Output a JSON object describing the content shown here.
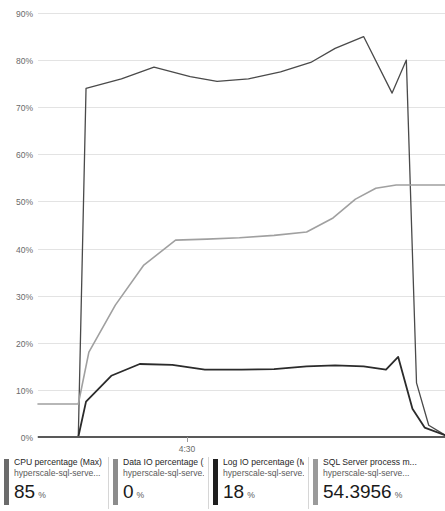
{
  "chart_data": {
    "type": "line",
    "title": "",
    "xlabel": "",
    "ylabel": "",
    "ylim": [
      0,
      90
    ],
    "y_ticks": [
      0,
      10,
      20,
      30,
      40,
      50,
      60,
      70,
      80,
      90
    ],
    "y_tick_labels": [
      "0%",
      "10%",
      "20%",
      "30%",
      "40%",
      "50%",
      "60%",
      "70%",
      "80%",
      "90%"
    ],
    "x_ticks": [
      "4:30"
    ],
    "x_tick_labels": [
      "4:30"
    ],
    "grid": true,
    "legend_position": "bottom",
    "x_domain": [
      0,
      100
    ],
    "series": [
      {
        "name": "CPU percentage (Max)",
        "color": "#4a4a4a",
        "x": [
          9.9,
          11.8,
          20.5,
          28.5,
          37.4,
          44.0,
          51.7,
          59.6,
          67.0,
          73.0,
          80.0,
          87.0,
          90.5,
          93.0,
          96.0,
          100.0
        ],
        "values": [
          0,
          74.0,
          76.0,
          78.5,
          76.5,
          75.5,
          76.0,
          77.5,
          79.5,
          82.5,
          85.0,
          73.0,
          80.0,
          11.5,
          2.5,
          0.4
        ]
      },
      {
        "name": "Data IO percentage (Avg)",
        "color": "#8c8c8c",
        "x": [
          0,
          100
        ],
        "values": [
          0,
          0
        ]
      },
      {
        "name": "Log IO percentage (Max)",
        "color": "#2b2b2b",
        "x": [
          9.9,
          11.8,
          18.0,
          25.0,
          33.0,
          41.0,
          50.0,
          58.0,
          66.0,
          73.0,
          80.0,
          85.5,
          88.5,
          92.0,
          95.0,
          100.0
        ],
        "values": [
          0,
          7.5,
          13.0,
          15.5,
          15.3,
          14.3,
          14.3,
          14.4,
          15.0,
          15.2,
          15.0,
          14.3,
          17.0,
          6.0,
          2.0,
          0.4
        ]
      },
      {
        "name": "SQL Server process memory percentage (Avg)",
        "color": "#a0a0a0",
        "x": [
          0,
          9.9,
          12.5,
          19.0,
          26.0,
          33.8,
          41.5,
          49.5,
          58.0,
          66.0,
          72.5,
          78.0,
          83.0,
          88.0,
          94.0,
          100.0
        ],
        "values": [
          7.0,
          7.0,
          18.0,
          28.0,
          36.5,
          41.8,
          42.0,
          42.3,
          42.8,
          43.5,
          46.5,
          50.5,
          52.8,
          53.5,
          53.5,
          53.5
        ]
      }
    ]
  },
  "chart": {
    "y_axis": {
      "labels": [
        "90%",
        "80%",
        "70%",
        "60%",
        "50%",
        "40%",
        "30%",
        "20%",
        "10%",
        "0%"
      ]
    },
    "x_axis": {
      "labels": [
        "4:30"
      ]
    }
  },
  "legend": {
    "items": [
      {
        "metric": "CPU percentage (Max)",
        "resource": "hyperscale-sql-serve...",
        "value": "85",
        "unit": "%",
        "color": "#6b6b6b"
      },
      {
        "metric": "Data IO percentage (...",
        "resource": "hyperscale-sql-serve...",
        "value": "0",
        "unit": "%",
        "color": "#8c8c8c"
      },
      {
        "metric": "Log IO percentage (Max)",
        "resource": "hyperscale-sql-serve...",
        "value": "18",
        "unit": "%",
        "color": "#1f1f1f"
      },
      {
        "metric": "SQL Server process m...",
        "resource": "hyperscale-sql-serve...",
        "value": "54.3956",
        "unit": "%",
        "color": "#9a9a9a"
      }
    ]
  },
  "colors": {
    "grid": "#e3e3e3",
    "axis": "#595959",
    "text": "#3a3a3a"
  }
}
